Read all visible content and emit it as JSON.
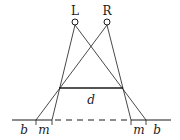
{
  "diagram": {
    "type": "stereo-vision geometry",
    "labels": {
      "left_eye": "L",
      "right_eye": "R",
      "distance": "d",
      "outer_left": "b",
      "inner_left": "m",
      "inner_right": "m",
      "outer_right": "b"
    },
    "colors": {
      "stroke": "#1a1a1a",
      "background": "#ffffff"
    }
  }
}
